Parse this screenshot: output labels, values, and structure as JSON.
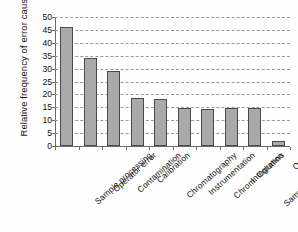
{
  "chart_data": {
    "type": "bar",
    "title": "",
    "xlabel": "",
    "ylabel": "Relative  frequency of error cause",
    "ylim": [
      0,
      50
    ],
    "yticks": [
      0,
      5,
      10,
      15,
      20,
      25,
      30,
      35,
      40,
      45,
      50
    ],
    "grid": true,
    "legend": "none",
    "categories": [
      "Sample processing",
      "Operator error",
      "Contamination",
      "Calibration",
      "Chromatography",
      "Instrumentation",
      "Chrom. Columns",
      "Integration",
      "Sample introduction",
      "Other"
    ],
    "values": [
      46,
      34.3,
      29,
      18.6,
      18.3,
      14.7,
      14.5,
      14.6,
      14.6,
      2
    ],
    "bar_color": "#a9a9a9",
    "bar_edge_color": "#4a4a4a",
    "grid_color": "#9a9a9a",
    "axis_color": "#6b6b6b"
  }
}
